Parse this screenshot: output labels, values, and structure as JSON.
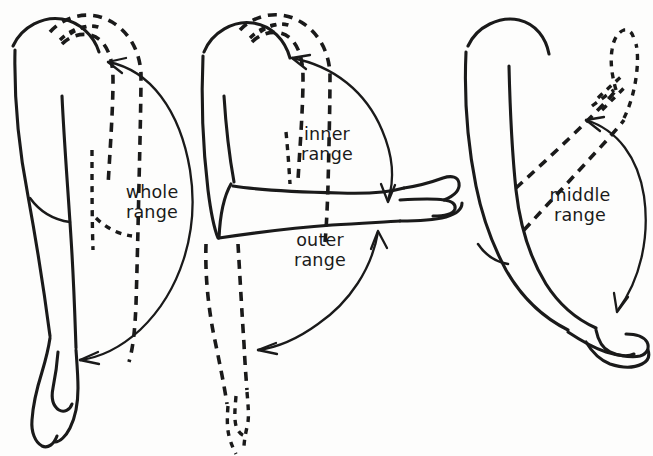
{
  "figure": {
    "background_color": "#fdfdfc",
    "ink_color": "#1a1a1a",
    "width": 653,
    "height": 456
  },
  "labels": {
    "whole_range": "whole\nrange",
    "inner_range": "inner\nrange",
    "outer_range": "outer\nrange",
    "middle_range": "middle\nrange"
  },
  "panels": [
    {
      "id": "panel-whole-range",
      "label": "whole\nrange",
      "description": "Side view of a shoulder and arm. The arm is drawn solid hanging down at the side and dashed raised overhead alongside the head; a long curved double-headed arrow spans between the two positions.",
      "solid_position": "arm hanging down by the side",
      "dashed_position": "arm raised fully overhead",
      "arrow": "curved double-headed arrow, both ends arrowheads"
    },
    {
      "id": "panel-inner-and-outer-range",
      "label_top": "inner\nrange",
      "label_bottom": "outer\nrange",
      "description": "Side view of a shoulder and arm. The arm is drawn solid held horizontally forwards and dashed both raised overhead (inner range) and hanging down (outer range); two curved double-headed arrows mark each half of the travel.",
      "solid_position": "arm held horizontally forward",
      "dashed_positions": [
        "arm raised overhead",
        "arm hanging down"
      ],
      "arrows": [
        "upper curved double-headed arrow between horizontal and overhead",
        "lower curved double-headed arrow between horizontal and hanging down"
      ]
    },
    {
      "id": "panel-middle-range",
      "label": "middle\nrange",
      "description": "Side view of a shoulder and arm. The arm is drawn solid hanging down and dashed raised diagonally forwards to about shoulder height; a curved double-headed arrow spans the middle portion of the arc.",
      "solid_position": "arm hanging down and slightly forward",
      "dashed_position": "arm raised diagonally forwards",
      "arrow": "curved double-headed arrow, both ends arrowheads"
    }
  ]
}
